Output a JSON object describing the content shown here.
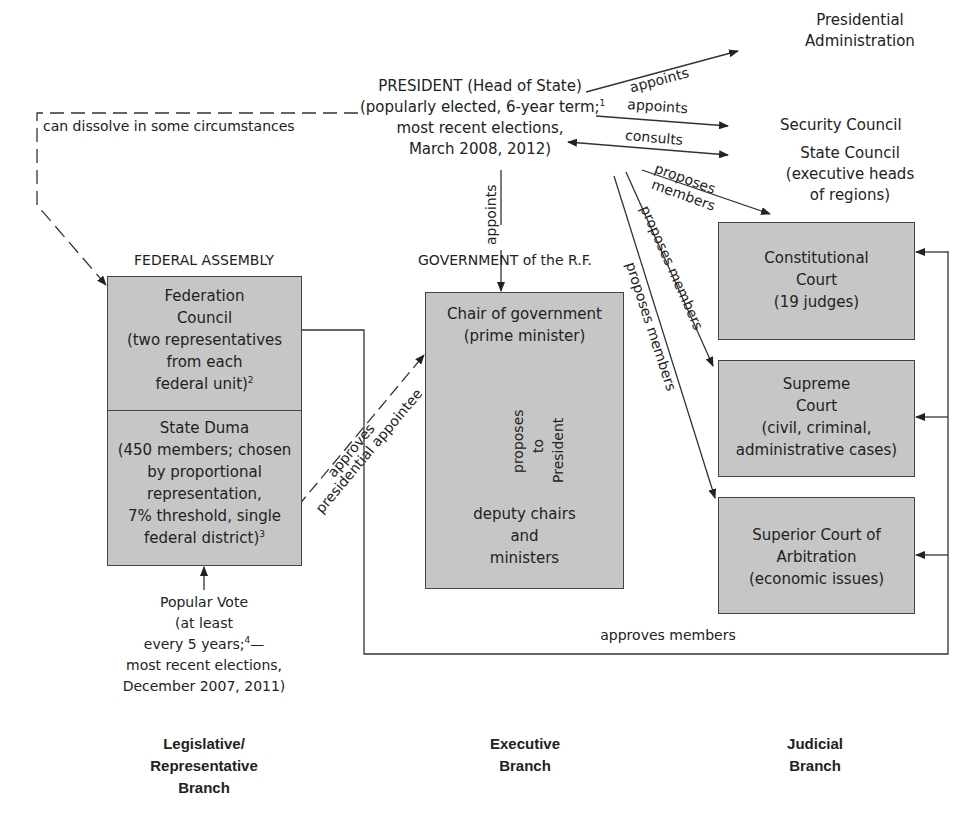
{
  "president": {
    "line1": "PRESIDENT (Head of State)",
    "line2": "(popularly elected, 6-year term;",
    "footnote": "1",
    "line3": "most recent elections,",
    "line4": "March 2008, 2012)"
  },
  "president_links": [
    {
      "label": "appoints",
      "target_lines": [
        "Presidential",
        "Administration"
      ]
    },
    {
      "label": "appoints",
      "target_lines": [
        "Security Council"
      ]
    },
    {
      "label": "consults",
      "target_lines": [
        "State Council",
        "(executive heads",
        "of regions)"
      ]
    }
  ],
  "dissolve_label": "can dissolve in some circumstances",
  "appoints_government_label": "appoints",
  "legislative": {
    "title": "FEDERAL ASSEMBLY",
    "federation_council": [
      "Federation",
      "Council",
      "(two representatives",
      "from each",
      "federal unit)"
    ],
    "federation_council_footnote": "2",
    "state_duma": [
      "State Duma",
      "(450 members; chosen",
      "by proportional",
      "representation,",
      "7% threshold, single",
      "federal district)"
    ],
    "state_duma_footnote": "3",
    "popular_vote": [
      "Popular Vote",
      "(at least",
      "every 5 years;",
      "most recent elections,",
      "December 2007, 2011)"
    ],
    "popular_vote_footnote": "4",
    "approves_label_1": "approves",
    "approves_label_2": "presidential appointee"
  },
  "executive": {
    "title": "GOVERNMENT of the R.F.",
    "chair": [
      "Chair of government",
      "(prime minister)"
    ],
    "proposes_label": [
      "proposes",
      "to",
      "President"
    ],
    "deputies": [
      "deputy chairs",
      "and",
      "ministers"
    ]
  },
  "judicial": {
    "proposes_members_labels": [
      "proposes members",
      "proposes members",
      "proposes members"
    ],
    "proposes_members_top": [
      "proposes",
      "members"
    ],
    "constitutional_court": [
      "Constitutional",
      "Court",
      "(19 judges)"
    ],
    "supreme_court": [
      "Supreme",
      "Court",
      "(civil, criminal,",
      "administrative cases)"
    ],
    "superior_court": [
      "Superior Court of",
      "Arbitration",
      "(economic issues)"
    ],
    "approves_members_label": "approves members"
  },
  "branches": {
    "legislative": [
      "Legislative/",
      "Representative",
      "Branch"
    ],
    "executive": [
      "Executive",
      "Branch"
    ],
    "judicial": [
      "Judicial",
      "Branch"
    ]
  },
  "colors": {
    "box_fill": "#c6c6c6",
    "line": "#333333"
  }
}
